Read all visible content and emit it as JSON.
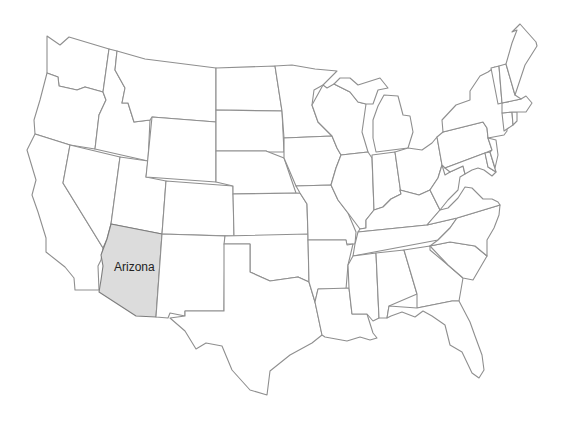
{
  "map": {
    "type": "US states outline map",
    "highlighted_state": {
      "name": "Arizona",
      "label": "Arizona",
      "fill": "#dcdcdc"
    },
    "colors": {
      "background": "#ffffff",
      "state_fill": "#ffffff",
      "state_stroke": "#8f8f8f",
      "highlight_fill": "#dcdcdc",
      "label_color": "#222222"
    },
    "states": [
      "Washington",
      "Oregon",
      "California",
      "Idaho",
      "Nevada",
      "Utah",
      "Arizona",
      "Montana",
      "Wyoming",
      "Colorado",
      "New Mexico",
      "North Dakota",
      "South Dakota",
      "Nebraska",
      "Kansas",
      "Oklahoma",
      "Texas",
      "Minnesota",
      "Iowa",
      "Missouri",
      "Arkansas",
      "Louisiana",
      "Wisconsin",
      "Illinois",
      "Michigan",
      "Indiana",
      "Ohio",
      "Kentucky",
      "Tennessee",
      "Mississippi",
      "Alabama",
      "Georgia",
      "Florida",
      "South Carolina",
      "North Carolina",
      "Virginia",
      "West Virginia",
      "Pennsylvania",
      "New York",
      "Maryland",
      "Delaware",
      "New Jersey",
      "Connecticut",
      "Rhode Island",
      "Massachusetts",
      "Vermont",
      "New Hampshire",
      "Maine"
    ]
  }
}
